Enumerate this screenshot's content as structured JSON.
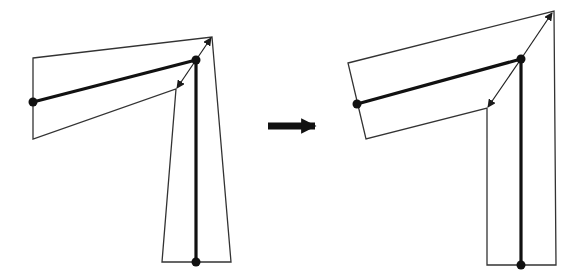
{
  "colors": {
    "background": "#ffffff",
    "stroke": "#1a1a1a",
    "thin_stroke": "#333333"
  },
  "diagram": {
    "left_figure": {
      "outline": "33,58 212,37 231,262 162,262 176,89 33,139",
      "bone_horizontal": {
        "x1": 33,
        "y1": 102,
        "x2": 196,
        "y2": 60
      },
      "bone_vertical": {
        "x1": 196,
        "y1": 60,
        "x2": 196,
        "y2": 262
      },
      "joints": [
        {
          "cx": 33,
          "cy": 102
        },
        {
          "cx": 196,
          "cy": 60
        },
        {
          "cx": 196,
          "cy": 262
        }
      ],
      "arrow_out": {
        "x1": 196,
        "y1": 60,
        "x2": 211,
        "y2": 38
      },
      "arrow_in": {
        "x1": 196,
        "y1": 60,
        "x2": 177,
        "y2": 88
      }
    },
    "transition_arrow": {
      "x1": 268,
      "y1": 126,
      "x2": 315,
      "y2": 126
    },
    "right_figure": {
      "outline": "348,63 554,11 556,265 487,265 487,108 366,139",
      "bone_horizontal": {
        "x1": 357,
        "y1": 104,
        "x2": 521,
        "y2": 59
      },
      "bone_vertical": {
        "x1": 521,
        "y1": 59,
        "x2": 521,
        "y2": 265
      },
      "joints": [
        {
          "cx": 357,
          "cy": 104
        },
        {
          "cx": 521,
          "cy": 59
        },
        {
          "cx": 521,
          "cy": 265
        }
      ],
      "arrow_out": {
        "x1": 521,
        "y1": 59,
        "x2": 552,
        "y2": 13
      },
      "arrow_in": {
        "x1": 521,
        "y1": 59,
        "x2": 488,
        "y2": 107
      }
    }
  }
}
